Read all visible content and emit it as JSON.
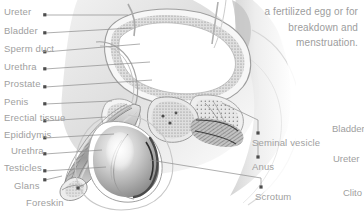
{
  "figure": {
    "background_color": "#ffffff",
    "label_color": "#a0a0a0",
    "leader_color": "#8c8c8c"
  },
  "blurb": {
    "lines": [
      "a fertilized egg or for",
      "breakdown and",
      "menstruation."
    ]
  },
  "labels_left": [
    {
      "text": "Ureter",
      "x": 4,
      "y": 7,
      "dot_x": 45,
      "dot_y": 15,
      "end_x": 128,
      "end_y": 15
    },
    {
      "text": "Bladder",
      "x": 4,
      "y": 26,
      "dot_x": 45,
      "dot_y": 33,
      "end_x": 132,
      "end_y": 28
    },
    {
      "text": "Sperm duct",
      "x": 4,
      "y": 44,
      "dot_x": 45,
      "dot_y": 52,
      "end_x": 140,
      "end_y": 44
    },
    {
      "text": "Urethra",
      "x": 4,
      "y": 62,
      "dot_x": 45,
      "dot_y": 69,
      "end_x": 150,
      "end_y": 62
    },
    {
      "text": "Prostate",
      "x": 4,
      "y": 79,
      "dot_x": 45,
      "dot_y": 87,
      "end_x": 150,
      "end_y": 80
    },
    {
      "text": "Penis",
      "x": 4,
      "y": 97,
      "dot_x": 45,
      "dot_y": 104,
      "end_x": 108,
      "end_y": 100
    },
    {
      "text": "Erectial tissue",
      "x": 4,
      "y": 113,
      "dot_x": 45,
      "dot_y": 121,
      "end_x": 104,
      "end_y": 116
    },
    {
      "text": "Epididymis",
      "x": 4,
      "y": 130,
      "dot_x": 45,
      "dot_y": 138,
      "end_x": 112,
      "end_y": 134
    },
    {
      "text": "Urethra",
      "x": 10,
      "y": 146,
      "dot_x": 45,
      "dot_y": 154,
      "end_x": 100,
      "end_y": 150
    },
    {
      "text": "Testicles",
      "x": 4,
      "y": 163,
      "dot_x": 45,
      "dot_y": 171,
      "end_x": 105,
      "end_y": 167
    },
    {
      "text": "Glans",
      "x": 14,
      "y": 181,
      "dot_x": 45,
      "dot_y": 180,
      "end_x": 78,
      "end_y": 178
    },
    {
      "text": "Foreskin",
      "x": 26,
      "y": 198,
      "dot_x": 78,
      "dot_y": 188,
      "end_x": 88,
      "end_y": 183
    }
  ],
  "labels_right": [
    {
      "text": "Seminal vesicle",
      "x": 252,
      "y": 138,
      "dot_x": 258,
      "dot_y": 133,
      "path": "M258,133 L258,120 L222,103"
    },
    {
      "text": "Anus",
      "x": 252,
      "y": 163,
      "dot_x": 258,
      "dot_y": 157,
      "path": "M258,157 L258,141"
    },
    {
      "text": "Scrotum",
      "x": 255,
      "y": 194,
      "dot_x": 261,
      "dot_y": 187,
      "path": "M261,187 L261,180 L152,162"
    }
  ],
  "labels_edge": [
    {
      "text": "Bladder",
      "x": 332,
      "y": 124
    },
    {
      "text": "Ureter",
      "x": 333,
      "y": 154
    },
    {
      "text": "Clito",
      "x": 343,
      "y": 188
    }
  ]
}
